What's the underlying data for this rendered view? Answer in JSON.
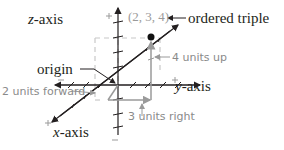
{
  "diagram": {
    "labels": {
      "z_axis_var": "z",
      "z_axis_suffix": "-axis",
      "y_axis_var": "y",
      "y_axis_suffix": "-axis",
      "x_axis_var": "x",
      "x_axis_suffix": "-axis",
      "origin": "origin",
      "ordered_triple_value": "(2, 3, 4)",
      "ordered_triple_label": "ordered triple",
      "up": "4 units up",
      "forward": "2 units forward",
      "right": "3 units right"
    },
    "point": {
      "x": 2,
      "y": 3,
      "z": 4
    },
    "colors": {
      "axis": "#231f20",
      "guide": "#9a9a9a",
      "dashed_box": "#c8c8c8",
      "point": "#111111"
    }
  }
}
